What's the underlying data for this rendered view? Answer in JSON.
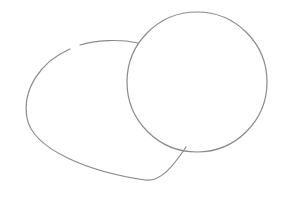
{
  "canvas": {
    "width": 290,
    "height": 200,
    "background": "#ffffff"
  },
  "stroke": {
    "color": "#8a8a8a",
    "width": 1.2
  },
  "shapes": [
    {
      "name": "blob",
      "type": "path",
      "d": "M 138 43 C 120 39, 95 40, 80 45 M 70 49 C 40 62, 22 90, 27 118 C 33 150, 90 172, 145 180 C 160 182, 172 168, 186 147"
    },
    {
      "name": "circle",
      "type": "circle",
      "cx": 197,
      "cy": 82,
      "r": 70
    }
  ]
}
